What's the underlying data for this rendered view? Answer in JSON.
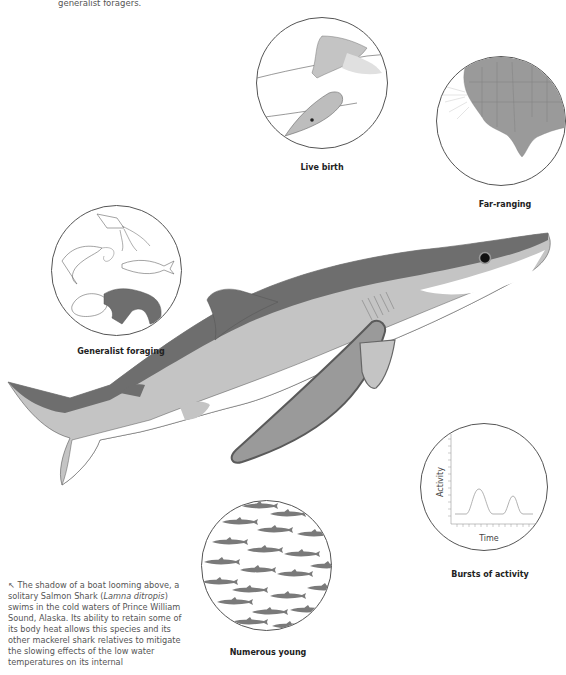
{
  "intro_text": "generalist foragers.",
  "panels": {
    "live_birth": {
      "label": "Live birth"
    },
    "far_ranging": {
      "label": "Far-ranging"
    },
    "generalist_foraging": {
      "label": "Generalist foraging"
    },
    "bursts_of_activity": {
      "label": "Bursts of activity",
      "ylabel": "Activity",
      "xlabel": "Time"
    },
    "numerous_young": {
      "label": "Numerous young"
    }
  },
  "caption": {
    "arrow": "↖",
    "part1": "The shadow of a boat looming above, a solitary Salmon Shark (",
    "species": "Lamna ditropis",
    "part2": ") swims in the cold waters of Prince William Sound, Alaska. Its ability to retain some of its body heat allows this species and its other mackerel shark relatives to mitigate the slowing effects of the low water temperatures on its internal"
  },
  "colors": {
    "dark_grey": "#6b6b6b",
    "mid_grey": "#9a9a9a",
    "light_grey": "#c4c4c4",
    "white": "#ffffff",
    "outline": "#555555"
  }
}
